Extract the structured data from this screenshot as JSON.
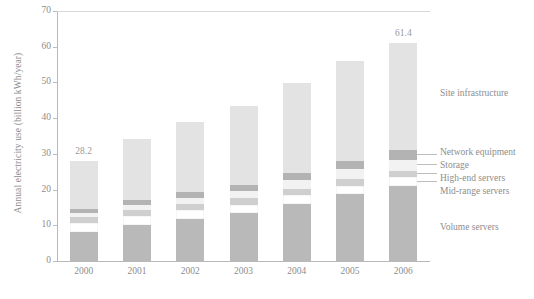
{
  "chart_data": {
    "type": "bar",
    "stacked": true,
    "title": "",
    "xlabel": "",
    "ylabel": "Annual electricity use (billion kWh/year)",
    "categories": [
      "2000",
      "2001",
      "2002",
      "2003",
      "2004",
      "2005",
      "2006"
    ],
    "ylim": [
      0,
      70
    ],
    "yticks": [
      "0",
      "10",
      "20",
      "30",
      "40",
      "50",
      "60",
      "70"
    ],
    "ytick_values": [
      0,
      10,
      20,
      30,
      40,
      50,
      60,
      70
    ],
    "grid": false,
    "legend_position": "right",
    "totals": [
      28.2,
      34.4,
      39.2,
      43.8,
      50.0,
      56.4,
      61.4
    ],
    "annotations": [
      {
        "category": "2000",
        "text": "28.2"
      },
      {
        "category": "2006",
        "text": "61.4"
      }
    ],
    "series": [
      {
        "name": "Volume servers",
        "color": "#b9b9b9",
        "values": [
          8.3,
          10.4,
          12.0,
          13.6,
          16.3,
          19.0,
          21.3
        ]
      },
      {
        "name": "Mid-range servers",
        "color": "#ffffff",
        "values": [
          2.6,
          2.6,
          2.6,
          2.5,
          2.5,
          2.4,
          2.4
        ]
      },
      {
        "name": "High-end servers",
        "color": "#cfcfcf",
        "values": [
          1.6,
          1.6,
          1.6,
          1.7,
          1.7,
          1.8,
          1.8
        ]
      },
      {
        "name": "Storage",
        "color": "#f2f2f2",
        "values": [
          1.1,
          1.4,
          1.7,
          2.0,
          2.4,
          2.8,
          3.2
        ]
      },
      {
        "name": "Network equipment",
        "color": "#b3b3b3",
        "values": [
          1.2,
          1.4,
          1.6,
          1.8,
          2.1,
          2.4,
          2.6
        ]
      },
      {
        "name": "Site infrastructure",
        "color": "#e3e3e3",
        "values": [
          13.4,
          17.0,
          19.7,
          22.2,
          25.0,
          28.0,
          30.1
        ]
      }
    ],
    "legend_entries": [
      {
        "label": "Site infrastructure",
        "color": "#e3e3e3"
      },
      {
        "label": "Network equipment",
        "color": "#b3b3b3"
      },
      {
        "label": "Storage",
        "color": "#f2f2f2"
      },
      {
        "label": "High-end servers",
        "color": "#cfcfcf"
      },
      {
        "label": "Mid-range servers",
        "color": "#ffffff"
      },
      {
        "label": "Volume servers",
        "color": "#b9b9b9"
      }
    ]
  }
}
